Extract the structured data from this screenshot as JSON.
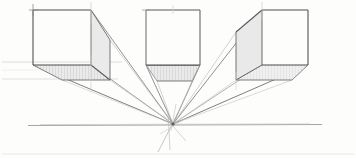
{
  "document": {
    "title": "One-Point Perspective Cube Study",
    "medium": "pencil sketch",
    "background_color": "#fdfdfc"
  },
  "colors": {
    "ink_strong": "#4a4a4a",
    "ink_medium": "#6e6e6e",
    "ink_light": "#9a9a9a",
    "ink_faint": "#c8c8c8",
    "ink_ghost": "#dcdcdc",
    "shade_fill": "#e6e6e6",
    "shade_fill_soft": "#ededed",
    "paper": "#fdfdfc"
  },
  "diagram": {
    "type": "one-point-perspective-construction",
    "canvas": {
      "width": 356,
      "height": 158
    },
    "vanishing_point": {
      "label": "VP",
      "x": 173,
      "y": 124
    },
    "horizon_line": {
      "label": "Horizon Line",
      "x1": 28,
      "y1": 125,
      "x2": 322,
      "y2": 125
    },
    "guide_lines": [
      {
        "label": "upper-guide",
        "x1": 2,
        "y1": 62,
        "x2": 120,
        "y2": 62
      },
      {
        "label": "lower-guide",
        "x1": 2,
        "y1": 79,
        "x2": 120,
        "y2": 79
      },
      {
        "label": "baseline-guide",
        "x1": 2,
        "y1": 154,
        "x2": 354,
        "y2": 154
      }
    ],
    "cubes": [
      {
        "name": "left-cube",
        "position": "left of vanishing point",
        "visible_faces": [
          "front",
          "right",
          "bottom"
        ],
        "front_face": {
          "left": 33,
          "top": 10,
          "right": 91,
          "bottom": 65
        },
        "receding_corners": {
          "top_right_back": {
            "x": 110,
            "y": 40
          },
          "bottom_right_back": {
            "x": 110,
            "y": 80
          },
          "bottom_left_back": {
            "x": 62,
            "y": 80
          }
        },
        "shaded_faces": [
          "right",
          "bottom"
        ]
      },
      {
        "name": "center-cube",
        "position": "aligned above vanishing point",
        "visible_faces": [
          "front",
          "bottom"
        ],
        "front_face": {
          "left": 146,
          "top": 10,
          "right": 200,
          "bottom": 65
        },
        "receding_corners": {
          "bottom_left_back": {
            "x": 157,
            "y": 81
          },
          "bottom_right_back": {
            "x": 192,
            "y": 81
          }
        },
        "shaded_faces": [
          "bottom"
        ]
      },
      {
        "name": "right-cube",
        "position": "right of vanishing point",
        "visible_faces": [
          "front",
          "left",
          "bottom"
        ],
        "front_face": {
          "left": 262,
          "top": 10,
          "right": 308,
          "bottom": 65
        },
        "receding_corners": {
          "top_left_back": {
            "x": 236,
            "y": 32
          },
          "bottom_left_back": {
            "x": 236,
            "y": 80
          },
          "bottom_right_back": {
            "x": 292,
            "y": 80
          }
        },
        "shaded_faces": [
          "left",
          "bottom"
        ]
      }
    ],
    "convergence_rays": [
      {
        "from": {
          "x": 91,
          "y": 10
        },
        "strength": "strong"
      },
      {
        "from": {
          "x": 110,
          "y": 40
        },
        "strength": "medium"
      },
      {
        "from": {
          "x": 33,
          "y": 65
        },
        "strength": "strong"
      },
      {
        "from": {
          "x": 91,
          "y": 65
        },
        "strength": "medium"
      },
      {
        "from": {
          "x": 110,
          "y": 80
        },
        "strength": "light"
      },
      {
        "from": {
          "x": 62,
          "y": 80
        },
        "strength": "light"
      },
      {
        "from": {
          "x": 146,
          "y": 65
        },
        "strength": "medium"
      },
      {
        "from": {
          "x": 200,
          "y": 65
        },
        "strength": "medium"
      },
      {
        "from": {
          "x": 157,
          "y": 81
        },
        "strength": "light"
      },
      {
        "from": {
          "x": 192,
          "y": 81
        },
        "strength": "light"
      },
      {
        "from": {
          "x": 262,
          "y": 10
        },
        "strength": "strong"
      },
      {
        "from": {
          "x": 236,
          "y": 32
        },
        "strength": "medium"
      },
      {
        "from": {
          "x": 308,
          "y": 65
        },
        "strength": "strong"
      },
      {
        "from": {
          "x": 262,
          "y": 65
        },
        "strength": "medium"
      },
      {
        "from": {
          "x": 236,
          "y": 80
        },
        "strength": "light"
      },
      {
        "from": {
          "x": 292,
          "y": 80
        },
        "strength": "light"
      }
    ],
    "overshoot_rays": [
      {
        "label": "vp-overshoot-down-left",
        "x2": 158,
        "y2": 152
      },
      {
        "label": "vp-overshoot-down",
        "x2": 170,
        "y2": 150
      },
      {
        "label": "vp-overshoot-down-right",
        "x2": 186,
        "y2": 141
      },
      {
        "label": "vp-overshoot-up",
        "x2": 176,
        "y2": 104
      }
    ],
    "construction_ticks": [
      {
        "label": "tick-left-cube-top",
        "x": 91,
        "y1": 2,
        "y2": 24
      },
      {
        "label": "tick-left-cube-vert",
        "x": 91,
        "y1": 55,
        "y2": 90
      },
      {
        "label": "tick-center-cube-top",
        "x": 173,
        "y1": 4,
        "y2": 16
      },
      {
        "label": "tick-right-cube-top",
        "x": 262,
        "y1": 2,
        "y2": 22
      },
      {
        "label": "tick-left-corner",
        "x": 33,
        "y1": 4,
        "y2": 14
      }
    ]
  }
}
